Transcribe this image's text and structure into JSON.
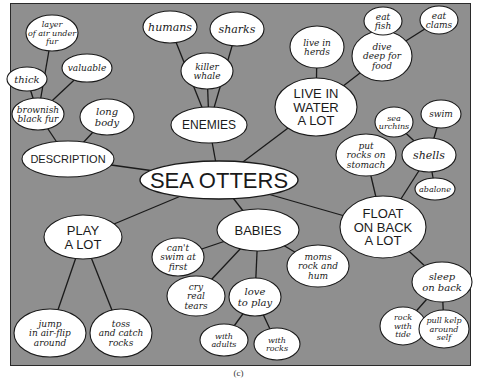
{
  "title": "SEA OTTERS",
  "caption": "(c)",
  "colors": {
    "background": "#8f8f8f",
    "bubble": "#ffffff",
    "line": "#1a1a1a"
  },
  "nodes": [
    {
      "id": "sea-otters",
      "lines": [
        "SEA OTTERS"
      ],
      "style": "center"
    },
    {
      "id": "description",
      "lines": [
        "DESCRIPTION"
      ],
      "style": "caps"
    },
    {
      "id": "brownish-black-fur",
      "lines": [
        "brownish",
        "black fur"
      ],
      "style": "hand"
    },
    {
      "id": "layer-of-air",
      "lines": [
        "layer",
        "of air under",
        "fur"
      ],
      "style": "hand"
    },
    {
      "id": "thick",
      "lines": [
        "thick"
      ],
      "style": "hand"
    },
    {
      "id": "valuable",
      "lines": [
        "valuable"
      ],
      "style": "hand"
    },
    {
      "id": "long-body",
      "lines": [
        "long",
        "body"
      ],
      "style": "hand"
    },
    {
      "id": "enemies",
      "lines": [
        "ENEMIES"
      ],
      "style": "caps"
    },
    {
      "id": "humans",
      "lines": [
        "humans"
      ],
      "style": "hand"
    },
    {
      "id": "sharks",
      "lines": [
        "sharks"
      ],
      "style": "hand"
    },
    {
      "id": "killer-whale",
      "lines": [
        "killer",
        "whale"
      ],
      "style": "hand"
    },
    {
      "id": "live-in-water",
      "lines": [
        "LIVE IN",
        "WATER",
        "A LOT"
      ],
      "style": "caps"
    },
    {
      "id": "live-in-herds",
      "lines": [
        "live in",
        "herds"
      ],
      "style": "hand"
    },
    {
      "id": "dive-deep",
      "lines": [
        "dive",
        "deep for",
        "food"
      ],
      "style": "hand"
    },
    {
      "id": "eat-fish",
      "lines": [
        "eat",
        "fish"
      ],
      "style": "hand"
    },
    {
      "id": "eat-clams",
      "lines": [
        "eat",
        "clams"
      ],
      "style": "hand"
    },
    {
      "id": "float-on-back",
      "lines": [
        "FLOAT",
        "ON BACK",
        "A LOT"
      ],
      "style": "caps"
    },
    {
      "id": "put-rocks",
      "lines": [
        "put",
        "rocks on",
        "stomach"
      ],
      "style": "hand"
    },
    {
      "id": "shells",
      "lines": [
        "shells"
      ],
      "style": "hand"
    },
    {
      "id": "sea-urchins",
      "lines": [
        "sea",
        "urchins"
      ],
      "style": "hand"
    },
    {
      "id": "swim",
      "lines": [
        "swim"
      ],
      "style": "hand"
    },
    {
      "id": "abalone",
      "lines": [
        "abalone"
      ],
      "style": "hand"
    },
    {
      "id": "sleep-on-back",
      "lines": [
        "sleep",
        "on back"
      ],
      "style": "hand"
    },
    {
      "id": "rock-with-tide",
      "lines": [
        "rock",
        "with",
        "tide"
      ],
      "style": "hand"
    },
    {
      "id": "pull-kelp",
      "lines": [
        "pull kelp",
        "around",
        "self"
      ],
      "style": "hand"
    },
    {
      "id": "babies",
      "lines": [
        "BABIES"
      ],
      "style": "caps"
    },
    {
      "id": "cant-swim",
      "lines": [
        "can't",
        "swim at",
        "first"
      ],
      "style": "hand"
    },
    {
      "id": "cry-real-tears",
      "lines": [
        "cry",
        "real",
        "tears"
      ],
      "style": "hand"
    },
    {
      "id": "love-to-play",
      "lines": [
        "love",
        "to play"
      ],
      "style": "hand"
    },
    {
      "id": "with-adults",
      "lines": [
        "with",
        "adults"
      ],
      "style": "hand"
    },
    {
      "id": "with-rocks",
      "lines": [
        "with",
        "rocks"
      ],
      "style": "hand"
    },
    {
      "id": "moms-rock",
      "lines": [
        "moms",
        "rock and",
        "hum"
      ],
      "style": "hand"
    },
    {
      "id": "play-a-lot",
      "lines": [
        "PLAY",
        "A LOT"
      ],
      "style": "caps"
    },
    {
      "id": "jump-in-air",
      "lines": [
        "jump",
        "in air-flip",
        "around"
      ],
      "style": "hand"
    },
    {
      "id": "toss-and-catch",
      "lines": [
        "toss",
        "and catch",
        "rocks"
      ],
      "style": "hand"
    }
  ],
  "edges": [
    [
      "sea-otters",
      "description"
    ],
    [
      "sea-otters",
      "enemies"
    ],
    [
      "sea-otters",
      "live-in-water"
    ],
    [
      "sea-otters",
      "float-on-back"
    ],
    [
      "sea-otters",
      "babies"
    ],
    [
      "sea-otters",
      "play-a-lot"
    ],
    [
      "description",
      "brownish-black-fur"
    ],
    [
      "description",
      "long-body"
    ],
    [
      "brownish-black-fur",
      "layer-of-air"
    ],
    [
      "brownish-black-fur",
      "thick"
    ],
    [
      "brownish-black-fur",
      "valuable"
    ],
    [
      "enemies",
      "humans"
    ],
    [
      "enemies",
      "sharks"
    ],
    [
      "enemies",
      "killer-whale"
    ],
    [
      "live-in-water",
      "live-in-herds"
    ],
    [
      "live-in-water",
      "dive-deep"
    ],
    [
      "dive-deep",
      "eat-fish"
    ],
    [
      "dive-deep",
      "eat-clams"
    ],
    [
      "float-on-back",
      "put-rocks"
    ],
    [
      "float-on-back",
      "shells"
    ],
    [
      "float-on-back",
      "sleep-on-back"
    ],
    [
      "shells",
      "sea-urchins"
    ],
    [
      "shells",
      "swim"
    ],
    [
      "shells",
      "abalone"
    ],
    [
      "sleep-on-back",
      "rock-with-tide"
    ],
    [
      "sleep-on-back",
      "pull-kelp"
    ],
    [
      "babies",
      "cant-swim"
    ],
    [
      "babies",
      "cry-real-tears"
    ],
    [
      "babies",
      "love-to-play"
    ],
    [
      "babies",
      "moms-rock"
    ],
    [
      "love-to-play",
      "with-adults"
    ],
    [
      "love-to-play",
      "with-rocks"
    ],
    [
      "play-a-lot",
      "jump-in-air"
    ],
    [
      "play-a-lot",
      "toss-and-catch"
    ]
  ]
}
